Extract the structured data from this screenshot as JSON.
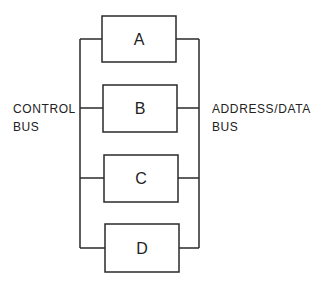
{
  "diagram": {
    "type": "bus-topology",
    "left_bus": {
      "label_line1": "CONTROL",
      "label_line2": "BUS"
    },
    "right_bus": {
      "label_line1": "ADDRESS/DATA",
      "label_line2": "BUS"
    },
    "modules": [
      {
        "id": "A",
        "label": "A"
      },
      {
        "id": "B",
        "label": "B"
      },
      {
        "id": "C",
        "label": "C"
      },
      {
        "id": "D",
        "label": "D"
      }
    ],
    "line_color": "#2a2a2a"
  }
}
